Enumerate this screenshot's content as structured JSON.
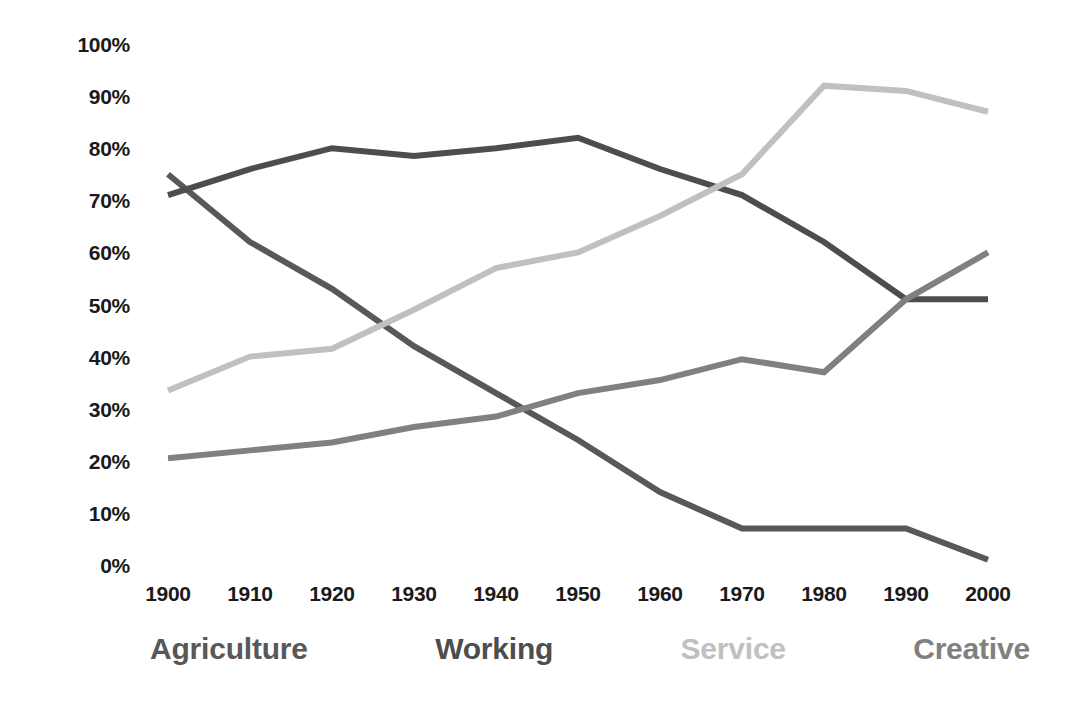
{
  "chart_data": {
    "type": "line",
    "title": "",
    "subtitle": "",
    "xlabel": "",
    "ylabel": "",
    "x": [
      1900,
      1910,
      1920,
      1930,
      1940,
      1950,
      1960,
      1970,
      1980,
      1990,
      2000
    ],
    "xtick_labels": [
      "1900",
      "1910",
      "1920",
      "1930",
      "1940",
      "1950",
      "1960",
      "1970",
      "1980",
      "1990",
      "2000"
    ],
    "ytick_labels": [
      "100%",
      "90%",
      "80%",
      "70%",
      "60%",
      "50%",
      "40%",
      "30%",
      "20%",
      "10%",
      "0%"
    ],
    "ytick_values": [
      100,
      90,
      80,
      70,
      60,
      50,
      40,
      30,
      20,
      10,
      0
    ],
    "ylim": [
      0,
      100
    ],
    "xlim": [
      1900,
      2000
    ],
    "grid": false,
    "legend_position": "bottom",
    "units": "percent",
    "series": [
      {
        "name": "Agriculture",
        "color": "#585858",
        "values": [
          75,
          62,
          53,
          42,
          33,
          24,
          14,
          7,
          7,
          7,
          1
        ]
      },
      {
        "name": "Working",
        "color": "#4d4d4d",
        "values": [
          71,
          76,
          80,
          78.5,
          80,
          82,
          76,
          71,
          62,
          51,
          51
        ]
      },
      {
        "name": "Service",
        "color": "#c0c0c0",
        "values": [
          33.5,
          40,
          41.5,
          49,
          57,
          60,
          67,
          75,
          92,
          91,
          87
        ]
      },
      {
        "name": "Creative",
        "color": "#808080",
        "values": [
          20.5,
          22,
          23.5,
          26.5,
          28.5,
          33,
          35.5,
          39.5,
          37,
          51,
          60
        ]
      }
    ]
  },
  "legend": {
    "items": [
      {
        "label": "Agriculture",
        "color": "#585858"
      },
      {
        "label": "Working",
        "color": "#4d4d4d"
      },
      {
        "label": "Service",
        "color": "#c0c0c0"
      },
      {
        "label": "Creative",
        "color": "#808080"
      }
    ]
  }
}
